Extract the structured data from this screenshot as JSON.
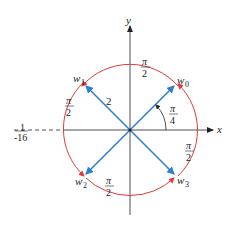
{
  "diagram": {
    "type": "complex-roots-diagram",
    "axes": {
      "x_label": "x",
      "y_label": "y"
    },
    "radius_label": "2",
    "angle_label": {
      "num": "π",
      "den": "4"
    },
    "arc_labels": [
      {
        "num": "π",
        "den": "2",
        "position": "top"
      },
      {
        "num": "π",
        "den": "2",
        "position": "left"
      },
      {
        "num": "π",
        "den": "2",
        "position": "bottom"
      },
      {
        "num": "π",
        "den": "2",
        "position": "right"
      }
    ],
    "roots": [
      {
        "name": "w",
        "sub": "0"
      },
      {
        "name": "w",
        "sub": "1"
      },
      {
        "name": "w",
        "sub": "2"
      },
      {
        "name": "w",
        "sub": "3"
      }
    ],
    "real_point": {
      "num": "1",
      "den": "-16"
    },
    "colors": {
      "vector": "#2f7fd0",
      "arc": "#e03a3a",
      "axis": "#222222"
    }
  }
}
